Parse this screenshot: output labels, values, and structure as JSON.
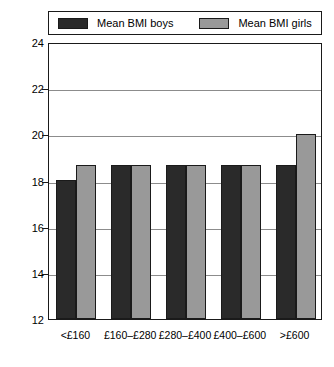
{
  "chart_data": {
    "type": "bar",
    "title": "",
    "subtitle": "",
    "xlabel": "",
    "ylabel": "",
    "categories": [
      "<£160",
      "£160–£280",
      "£280–£400",
      "£400–£600",
      ">£600"
    ],
    "series": [
      {
        "name": "Mean BMI boys",
        "color": "#2a2a2a",
        "values": [
          18.0,
          18.65,
          18.65,
          18.65,
          18.65
        ]
      },
      {
        "name": "Mean BMI girls",
        "color": "#999999",
        "values": [
          18.65,
          18.65,
          18.65,
          18.65,
          20.0
        ]
      }
    ],
    "ylim": [
      12,
      24
    ],
    "ytick_values": [
      24,
      22,
      20,
      18,
      16,
      14,
      12
    ],
    "ytick_labels": [
      "24",
      "22",
      "20",
      "18",
      "16",
      "14",
      "12"
    ],
    "grid": "horizontal",
    "legend_position": "top"
  },
  "legend": {
    "entries": [
      {
        "label": "Mean BMI boys",
        "color": "#2a2a2a"
      },
      {
        "label": "Mean BMI girls",
        "color": "#999999"
      }
    ]
  },
  "axes": {
    "y": {
      "ticks": [
        "24",
        "22",
        "20",
        "18",
        "16",
        "14",
        "12"
      ]
    },
    "x": {
      "ticks": [
        "<£160",
        "£160–£280",
        "£280–£400",
        "£400–£600",
        ">£600"
      ]
    }
  },
  "colors": {
    "boys": "#2a2a2a",
    "girls": "#999999",
    "axis": "#1a1a1a",
    "grid": "#8c8c8c",
    "background": "#ffffff"
  }
}
